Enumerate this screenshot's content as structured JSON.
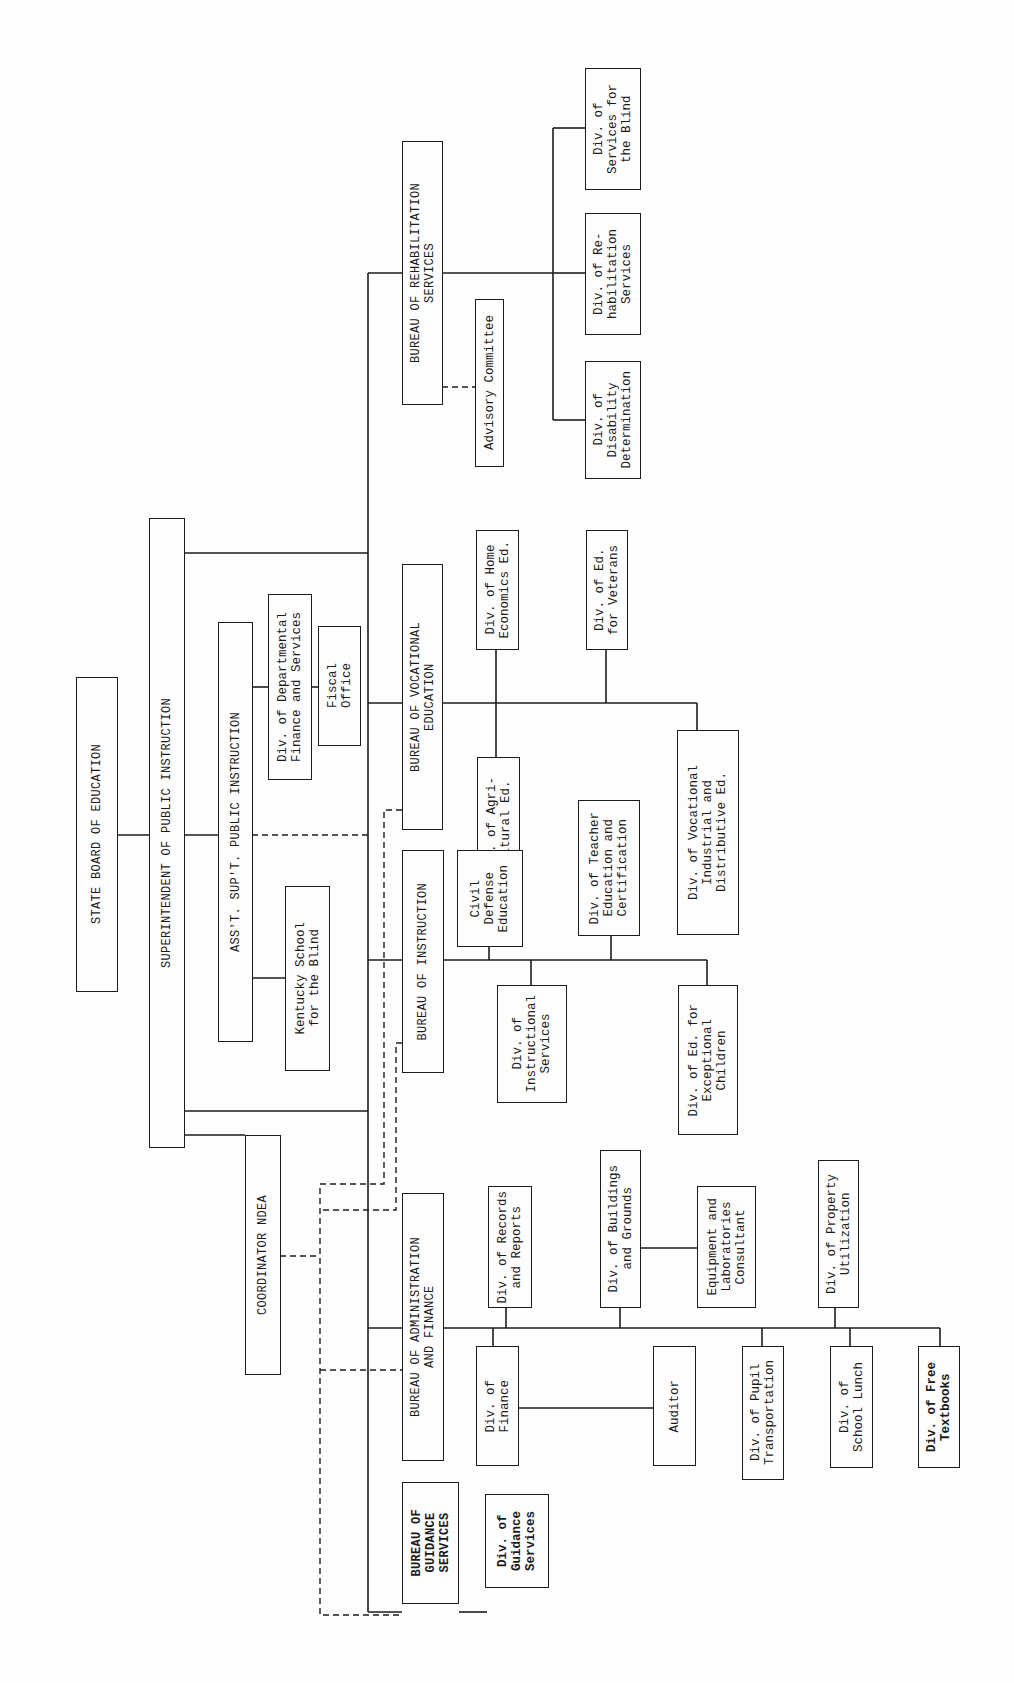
{
  "chart_title": "Organization chart — Kentucky State Department of Education",
  "orientation": "rotated 90 degrees counter-clockwise (text reads bottom-to-top)",
  "nodes": {
    "state_board": "STATE BOARD OF EDUCATION",
    "superintendent": "SUPERINTENDENT OF PUBLIC INSTRUCTION",
    "asst_supt": "ASS'T. SUP'T. PUBLIC INSTRUCTION",
    "coordinator_ndea": "COORDINATOR NDEA",
    "ky_school_blind": "Kentucky School\nfor the Blind",
    "div_dept_finance": "Div. of Departmental\nFinance and Services",
    "fiscal_office": "Fiscal\nOffice",
    "bureau_rehab": "BUREAU OF REHABILITATION\nSERVICES",
    "advisory_committee": "Advisory Committee",
    "div_disability": "Div. of\nDisability\nDetermination",
    "div_rehab_services": "Div. of Re-\nhabilitation\nServices",
    "div_services_blind": "Div. of\nServices for\nthe Blind",
    "bureau_vocational": "BUREAU OF VOCATIONAL\nEDUCATION",
    "div_home_econ": "Div. of Home\nEconomics Ed.",
    "div_ed_veterans": "Div. of Ed.\nfor Veterans",
    "div_agri": "Div. of Agri-\ncultural Ed.",
    "div_voc_industrial": "Div. of Vocational\nIndustrial and\nDistributive Ed.",
    "bureau_instruction": "BUREAU OF INSTRUCTION",
    "civil_defense": "Civil\nDefense\nEducation",
    "div_teacher_ed": "Div. of Teacher\nEducation and\nCertification",
    "div_instructional": "Div. of\nInstructional\nServices",
    "div_exceptional": "Div. of Ed. for\nExceptional\nChildren",
    "bureau_admin": "BUREAU OF ADMINISTRATION\nAND FINANCE",
    "div_records": "Div. of Records\nand Reports",
    "div_buildings": "Div. of Buildings\nand Grounds",
    "equipment_lab": "Equipment and\nLaboratories\nConsultant",
    "div_property": "Div. of Property\nUtilization",
    "div_finance": "Div. of\nFinance",
    "auditor": "Auditor",
    "div_pupil_transport": "Div. of Pupil\nTransportation",
    "div_school_lunch": "Div. of\nSchool Lunch",
    "div_free_textbooks": "Div. of Free\nTextbooks",
    "bureau_guidance": "BUREAU OF\nGUIDANCE\nSERVICES",
    "div_guidance": "Div. of\nGuidance\nServices"
  },
  "colors": {
    "line": "#1c1c1c",
    "paper": "#fdfdfd"
  }
}
